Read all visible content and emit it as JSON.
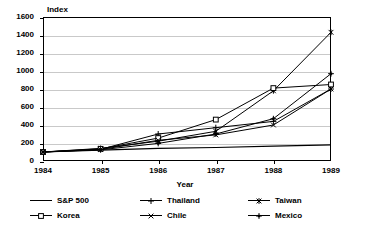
{
  "chart_data": {
    "type": "line",
    "title": "",
    "xlabel": "Year",
    "ylabel": "Index",
    "x": [
      1984,
      1985,
      1986,
      1987,
      1988,
      1989
    ],
    "xticklabels": [
      "1984",
      "1985",
      "1986",
      "1987",
      "1988",
      "1989"
    ],
    "yticklabels": [
      "0",
      "200",
      "400",
      "600",
      "800",
      "1000",
      "1200",
      "1400",
      "1600"
    ],
    "yticks": [
      0,
      200,
      400,
      600,
      800,
      1000,
      1200,
      1400,
      1600
    ],
    "ylim": [
      0,
      1600
    ],
    "xlim": [
      1984,
      1989
    ],
    "grid": "horizontal",
    "legend_position": "bottom",
    "series": [
      {
        "name": "S&P 500",
        "marker": "line",
        "values": [
          100,
          120,
          140,
          150,
          165,
          180
        ]
      },
      {
        "name": "Thailand",
        "marker": "plus",
        "values": [
          100,
          130,
          300,
          370,
          440,
          800
        ]
      },
      {
        "name": "Taiwan",
        "marker": "star",
        "values": [
          100,
          140,
          220,
          330,
          780,
          1430
        ]
      },
      {
        "name": "Korea",
        "marker": "square",
        "values": [
          100,
          135,
          255,
          460,
          810,
          850
        ]
      },
      {
        "name": "Chile",
        "marker": "cross",
        "values": [
          100,
          128,
          230,
          290,
          400,
          800
        ]
      },
      {
        "name": "Mexico",
        "marker": "dot",
        "values": [
          100,
          125,
          195,
          300,
          470,
          970
        ]
      }
    ]
  },
  "legend": {
    "items": [
      {
        "label": "S&P 500"
      },
      {
        "label": "Thailand"
      },
      {
        "label": "Taiwan"
      },
      {
        "label": "Korea"
      },
      {
        "label": "Chile"
      },
      {
        "label": "Mexico"
      }
    ]
  },
  "colors": {
    "ink": "#000000",
    "grid": "#c9c9c9",
    "background": "#ffffff"
  }
}
